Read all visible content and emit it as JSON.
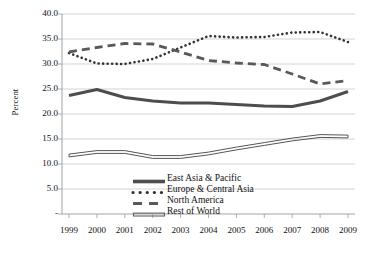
{
  "chart_data": {
    "type": "line",
    "title": "",
    "xlabel": "",
    "ylabel": "Percent",
    "grid": true,
    "legend_position": "inside-bottom-center",
    "x": [
      1999,
      2000,
      2001,
      2002,
      2003,
      2004,
      2005,
      2006,
      2007,
      2008,
      2009
    ],
    "xtick_labels": [
      "1999",
      "2000",
      "2001",
      "2002",
      "2003",
      "2004",
      "2005",
      "2006",
      "2007",
      "2008",
      "2009"
    ],
    "ytick_labels": [
      "40.0",
      "35.0",
      "30.0",
      "25.0",
      "20.0",
      "15.0",
      "10.0",
      "5.0",
      "-"
    ],
    "ytick_values": [
      40.0,
      35.0,
      30.0,
      25.0,
      20.0,
      15.0,
      10.0,
      5.0,
      0.0
    ],
    "ylim": [
      0.0,
      40.0
    ],
    "series": [
      {
        "name": "East Asia & Pacific",
        "style": "solid-thick",
        "color": "#4d4d4d",
        "values": [
          23.7,
          24.9,
          23.3,
          22.6,
          22.2,
          22.2,
          21.9,
          21.6,
          21.5,
          22.6,
          24.5
        ]
      },
      {
        "name": "Europe & Central Asia",
        "style": "dotted",
        "color": "#333333",
        "values": [
          32.2,
          30.1,
          30.0,
          31.0,
          33.3,
          35.6,
          35.3,
          35.4,
          36.3,
          36.4,
          34.4
        ]
      },
      {
        "name": "North America",
        "style": "dashed",
        "color": "#595959",
        "values": [
          32.4,
          33.3,
          34.1,
          34.0,
          32.4,
          30.7,
          30.2,
          29.9,
          28.0,
          26.0,
          26.7
        ]
      },
      {
        "name": "Rest of World",
        "style": "double-thin",
        "color": "#555555",
        "values": [
          11.7,
          12.4,
          12.4,
          11.4,
          11.4,
          12.1,
          13.1,
          14.0,
          14.9,
          15.6,
          15.5
        ]
      }
    ]
  },
  "legend": {
    "items": [
      {
        "label": "East Asia & Pacific",
        "key": "solid-thick-key"
      },
      {
        "label": "Europe & Central Asia",
        "key": "dotted-key"
      },
      {
        "label": "North America",
        "key": "dashed-key"
      },
      {
        "label": "Rest of World",
        "key": "double-thin-key"
      }
    ]
  },
  "axis": {
    "y_title": "Percent"
  }
}
